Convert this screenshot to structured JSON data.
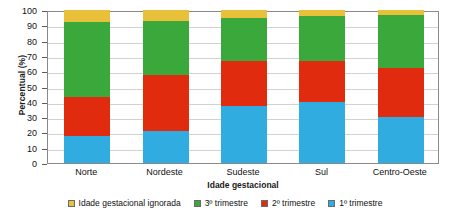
{
  "chart_data": {
    "type": "bar",
    "stacked": true,
    "title": "",
    "xlabel": "Idade gestacional",
    "ylabel": "Percentual (%)",
    "ylim": [
      0,
      100
    ],
    "ytick_step": 10,
    "yticks": [
      100,
      90,
      80,
      70,
      60,
      50,
      40,
      30,
      20,
      10,
      0
    ],
    "grid": true,
    "legend_position": "bottom",
    "categories": [
      "Norte",
      "Nordeste",
      "Sudeste",
      "Sul",
      "Centro-Oeste"
    ],
    "series": [
      {
        "name": "1º trimestre",
        "color": "#31ace0",
        "values": [
          17.5,
          21.0,
          37.0,
          40.0,
          30.0
        ]
      },
      {
        "name": "2º trimestre",
        "color": "#e02b0f",
        "values": [
          25.5,
          36.5,
          30.0,
          27.0,
          32.0
        ]
      },
      {
        "name": "3º trimestre",
        "color": "#3aa83a",
        "values": [
          49.0,
          35.5,
          28.0,
          29.0,
          34.5
        ]
      },
      {
        "name": "Idade gestacional ignorada",
        "color": "#e8c03a",
        "values": [
          8.0,
          7.0,
          5.0,
          4.0,
          3.5
        ]
      }
    ],
    "legend_order": [
      "Idade gestacional ignorada",
      "3º trimestre",
      "2º trimestre",
      "1º trimestre"
    ]
  }
}
